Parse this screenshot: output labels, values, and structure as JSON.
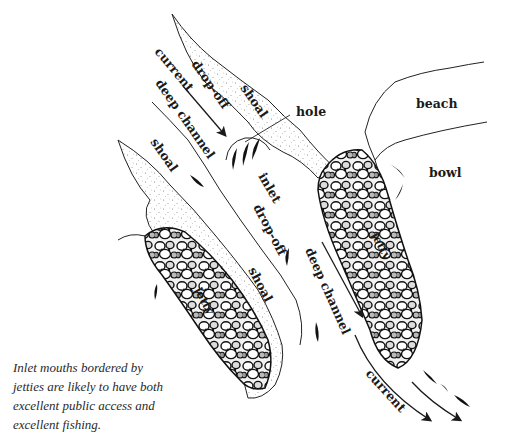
{
  "diagram": {
    "labels": {
      "current_top": "current",
      "drop_off_top": "drop-off",
      "shoal_top_right": "shoal",
      "hole": "hole",
      "beach": "beach",
      "bowl": "bowl",
      "deep_channel_top": "deep channel",
      "shoal_left": "shoal",
      "inlet": "inlet",
      "drop_off_mid": "drop-off",
      "shoal_mid": "shoal",
      "deep_channel_right": "deep channel",
      "jetty_left": "jetty",
      "jetty_right": "jetty",
      "current_bottom": "current"
    },
    "colors": {
      "ink": "#1a1a1a",
      "stipple": "#6b6b6b",
      "rock_fill": "#e9e9e9",
      "background": "#ffffff"
    }
  },
  "caption": {
    "lines": [
      "Inlet mouths bordered by",
      "jetties are likely to have both",
      "excellent public access and",
      "excellent fishing."
    ]
  }
}
